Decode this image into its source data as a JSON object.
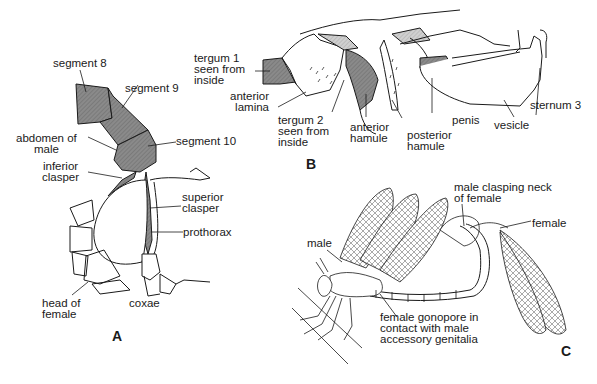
{
  "figure": {
    "panels": [
      {
        "id": "A",
        "label": "A",
        "labels": [
          {
            "text": "segment 8"
          },
          {
            "text": "segment 9"
          },
          {
            "text": "abdomen of\nmale"
          },
          {
            "text": "segment 10"
          },
          {
            "text": "inferior\nclasper"
          },
          {
            "text": "superior\nclasper"
          },
          {
            "text": "prothorax"
          },
          {
            "text": "head of\nfemale"
          },
          {
            "text": "coxae"
          }
        ]
      },
      {
        "id": "B",
        "label": "B",
        "labels": [
          {
            "text": "tergum 1\nseen from\ninside"
          },
          {
            "text": "anterior\nlamina"
          },
          {
            "text": "tergum 2\nseen from\ninside"
          },
          {
            "text": "anterior\nhamule"
          },
          {
            "text": "posterior\nhamule"
          },
          {
            "text": "penis"
          },
          {
            "text": "vesicle"
          },
          {
            "text": "sternum 3"
          }
        ]
      },
      {
        "id": "C",
        "label": "C",
        "labels": [
          {
            "text": "male clasping neck\nof female"
          },
          {
            "text": "female"
          },
          {
            "text": "male"
          },
          {
            "text": "female gonopore in\ncontact with male\naccessory genitalia"
          }
        ]
      }
    ],
    "colors": {
      "ink": "#1a1a1a",
      "dark_fill": "#7d7d7d",
      "light_fill": "#c4c4c4",
      "background": "#ffffff"
    }
  }
}
